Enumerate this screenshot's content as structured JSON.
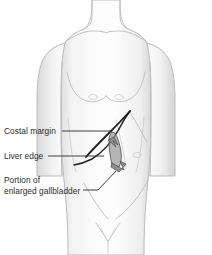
{
  "figure": {
    "background_color": "#ffffff",
    "body_outline_color": "#b9b9b9",
    "body_fill_color": "#fbfbfb",
    "overlay_line_color": "#232323",
    "gallbladder_fill_color": "#9a9a9a",
    "text_color": "#2b2b2b",
    "view": "anterior"
  },
  "annotations": [
    {
      "id": "costal-margin",
      "label": "Costal margin",
      "lines": [
        "Costal margin"
      ],
      "text_x": 4,
      "text_y": 134,
      "leader_path": "M 62 131 L 112 131",
      "leader_target_x": 112,
      "leader_target_y": 131
    },
    {
      "id": "liver-edge",
      "label": "Liver edge",
      "lines": [
        "Liver edge"
      ],
      "text_x": 4,
      "text_y": 159,
      "leader_path": "M 48 156 L 104 156",
      "leader_target_x": 104,
      "leader_target_y": 156
    },
    {
      "id": "enlarged-gallbladder",
      "label": "Portion of enlarged gallbladder",
      "lines": [
        "Portion of",
        "enlarged gallbladder"
      ],
      "text_x": 4,
      "text_y": 183,
      "leader_path": "M 83 190 L 98 190 L 116 171",
      "leader_target_x": 116,
      "leader_target_y": 171
    }
  ],
  "anatomy": {
    "regions": [
      "neck",
      "shoulders",
      "clavicles",
      "chest",
      "nipples",
      "abdomen",
      "umbilicus",
      "pelvis",
      "groin"
    ],
    "overlay_features": [
      "costal margin",
      "liver edge",
      "enlarged gallbladder"
    ]
  }
}
